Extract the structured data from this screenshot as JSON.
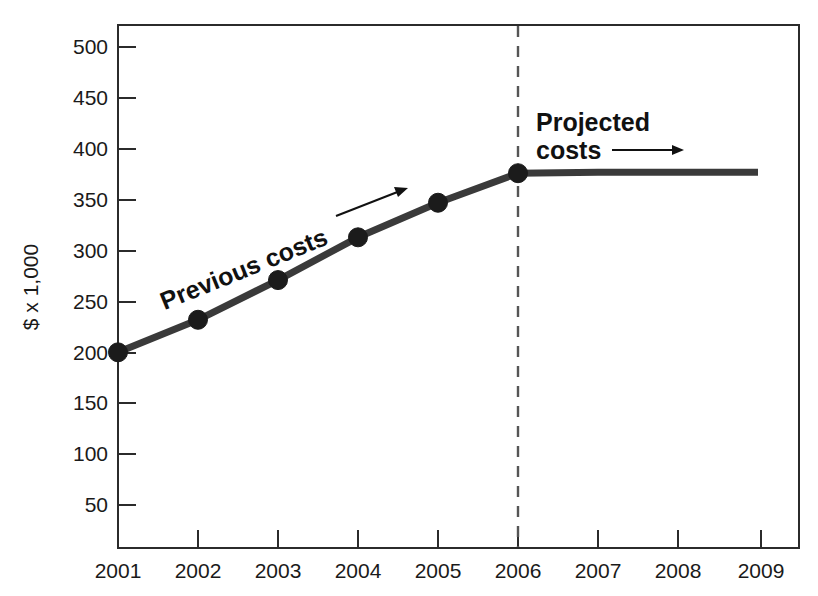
{
  "chart_data": {
    "type": "line",
    "title": "",
    "xlabel": "",
    "ylabel": "$ x 1,000",
    "x": [
      2001,
      2002,
      2003,
      2004,
      2005,
      2006,
      2007,
      2008,
      2009
    ],
    "xtick_labels": [
      "2001",
      "2002",
      "2003",
      "2004",
      "2005",
      "2006",
      "2007",
      "2008",
      "2009"
    ],
    "xlim": [
      2001,
      2009.55
    ],
    "ytick_labels": [
      "50",
      "100",
      "150",
      "200",
      "250",
      "300",
      "350",
      "400",
      "450",
      "500"
    ],
    "yticks": [
      50,
      100,
      150,
      200,
      250,
      300,
      350,
      400,
      450,
      500
    ],
    "ylim": [
      0,
      522
    ],
    "grid": false,
    "legend": "none",
    "series": [
      {
        "name": "Previous costs",
        "x": [
          2001,
          2002,
          2003,
          2004,
          2005,
          2006
        ],
        "values": [
          200,
          232,
          271,
          313,
          347,
          376
        ],
        "markers": true,
        "style": "solid"
      },
      {
        "name": "Projected costs",
        "x": [
          2006,
          2007,
          2008,
          2009
        ],
        "values": [
          376,
          377,
          377,
          377
        ],
        "markers": false,
        "style": "solid"
      }
    ],
    "annotations": [
      {
        "key": "previous",
        "text": "Previous costs",
        "rotation_deg": -22,
        "arrow": "up-right"
      },
      {
        "key": "projected",
        "line1": "Projected",
        "line2": "costs",
        "rotation_deg": 0,
        "arrow": "right"
      }
    ],
    "divider": {
      "at_x": 2006,
      "style": "dashed",
      "label": ""
    },
    "colors": {
      "series_line": "#3a3a3a",
      "marker": "#1b1b1b",
      "axis": "#2b2b2b",
      "divider": "#555555",
      "text": "#1a1a1a",
      "background": "#ffffff"
    }
  }
}
